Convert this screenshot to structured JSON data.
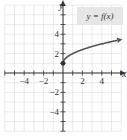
{
  "chart_data": {
    "type": "line",
    "title": "y = f(x)",
    "xlabel": "x",
    "ylabel": "y",
    "xlim": [
      -6,
      6
    ],
    "ylim": [
      -6,
      7
    ],
    "grid": true,
    "xticks": [
      -4,
      -2,
      2,
      4
    ],
    "yticks": [
      4,
      2,
      -2,
      -4
    ],
    "xtick_labels": [
      "−4",
      "−2",
      "2",
      "4"
    ],
    "ytick_labels": [
      "4",
      "2",
      "−2",
      "−4"
    ],
    "legend": {
      "text": "y = f(x)",
      "placement": "top-right"
    },
    "series": [
      {
        "name": "y = f(x)",
        "function": "sqrt(x) + 1",
        "x": [
          0,
          0.25,
          1,
          2,
          3,
          4,
          5,
          6
        ],
        "y": [
          1,
          1.5,
          2,
          2.41,
          2.73,
          3,
          3.24,
          3.45
        ],
        "start_point": {
          "x": 0,
          "y": 1,
          "filled": true
        },
        "end": "arrow"
      }
    ]
  }
}
